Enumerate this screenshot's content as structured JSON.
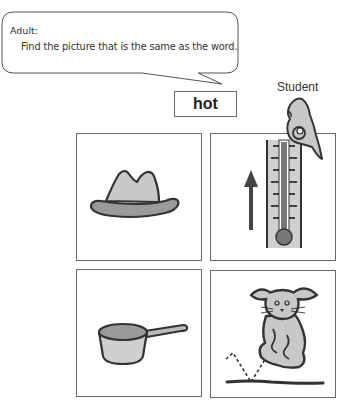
{
  "speech_bubble": {
    "speaker": "Adult:",
    "text": "Find the picture that is the same as the word."
  },
  "target_word": "hot",
  "student": {
    "label": "Student",
    "icon": "pointing-hand-icon"
  },
  "picture_cards": [
    {
      "id": "hat",
      "icon": "hat-icon",
      "description": "hat"
    },
    {
      "id": "thermometer",
      "icon": "thermometer-hot-icon",
      "description": "thermometer with up arrow (hot)",
      "selected_by_student": true
    },
    {
      "id": "saucepan",
      "icon": "saucepan-icon",
      "description": "saucepan"
    },
    {
      "id": "rabbit",
      "icon": "rabbit-hopping-icon",
      "description": "rabbit hopping"
    }
  ],
  "colors": {
    "outline": "#333333",
    "light_fill": "#c8c8c8",
    "mid_fill": "#9a9a9a",
    "dark_fill": "#555555",
    "border": "#666666"
  }
}
